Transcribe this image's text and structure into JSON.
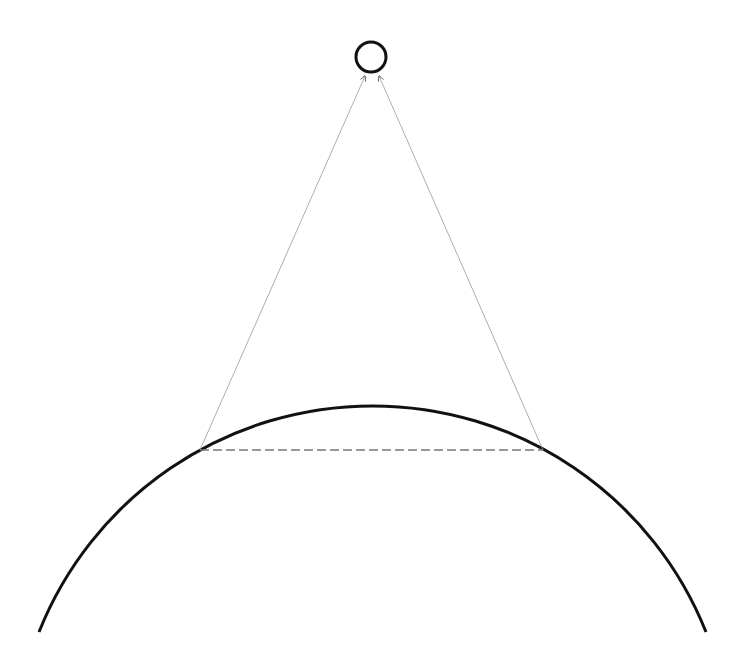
{
  "diagram": {
    "width": 746,
    "height": 672,
    "background": "#ffffff",
    "stroke_color": "#111111",
    "light_line_color": "#888888",
    "observer": {
      "cx": 371,
      "cy": 57,
      "r": 15
    },
    "planet_arc": {
      "cx": 372.5,
      "cy": 765,
      "r": 359,
      "start": [
        39,
        632
      ],
      "end": [
        706,
        632
      ]
    },
    "horizon_chord": {
      "x1": 200,
      "y1": 450,
      "x2": 543,
      "y2": 450,
      "style": "dashed"
    },
    "sight_lines": [
      {
        "from": [
          200,
          450
        ],
        "to": [
          365,
          76
        ]
      },
      {
        "from": [
          543,
          450
        ],
        "to": [
          379,
          76
        ]
      }
    ]
  }
}
